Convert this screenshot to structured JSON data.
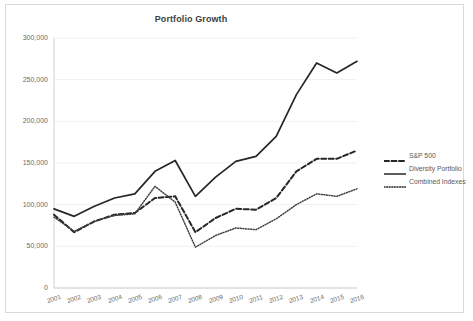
{
  "chart_data": {
    "type": "line",
    "title": "Portfolio Growth",
    "xlabel": "",
    "ylabel": "",
    "grid": true,
    "legend_position": "right",
    "ylim": [
      0,
      300000
    ],
    "ytick_labels": [
      "300,000",
      "250,000",
      "200,000",
      "150,000",
      "100,000",
      "50,000",
      "0"
    ],
    "ytick_values": [
      300000,
      250000,
      200000,
      150000,
      100000,
      50000,
      0
    ],
    "categories": [
      "2001",
      "2002",
      "2003",
      "2004",
      "2005",
      "2006",
      "2007",
      "2008",
      "2009",
      "2010",
      "2011",
      "2012",
      "2013",
      "2014",
      "2015",
      "2016"
    ],
    "x": [
      2001,
      2002,
      2003,
      2004,
      2005,
      2006,
      2007,
      2008,
      2009,
      2010,
      2011,
      2012,
      2013,
      2014,
      2015,
      2016
    ],
    "series": [
      {
        "name": "S&P 500",
        "style": "dashed",
        "color": "#262626",
        "values": [
          88000,
          67000,
          80000,
          88000,
          90000,
          108000,
          110000,
          67000,
          84000,
          95000,
          94000,
          108000,
          140000,
          155000,
          155000,
          165000
        ]
      },
      {
        "name": "Diversity Portfolio",
        "style": "solid",
        "color": "#262626",
        "values": [
          95000,
          86000,
          98000,
          108000,
          113000,
          140000,
          153000,
          110000,
          133000,
          152000,
          158000,
          182000,
          232000,
          270000,
          258000,
          272000
        ]
      },
      {
        "name": "Combined Indexes",
        "style": "dotted",
        "color": "#404040",
        "values": [
          85000,
          68000,
          80000,
          87000,
          89000,
          122000,
          103000,
          49000,
          63000,
          72000,
          70000,
          83000,
          100000,
          113000,
          110000,
          119000
        ]
      }
    ]
  },
  "legend": {
    "items": [
      {
        "label": "S&P 500",
        "style": "dashed"
      },
      {
        "label": "Diversity Portfolio",
        "style": "solid"
      },
      {
        "label": "Combined Indexes",
        "style": "dotted"
      }
    ]
  },
  "colors": {
    "frame_border": "#d9d9d9",
    "gridline": "#f0f0f0",
    "axis_line": "#d0d0d0",
    "tick_text": "#6a6a6a",
    "title_text": "#404040",
    "line_primary": "#262626"
  }
}
